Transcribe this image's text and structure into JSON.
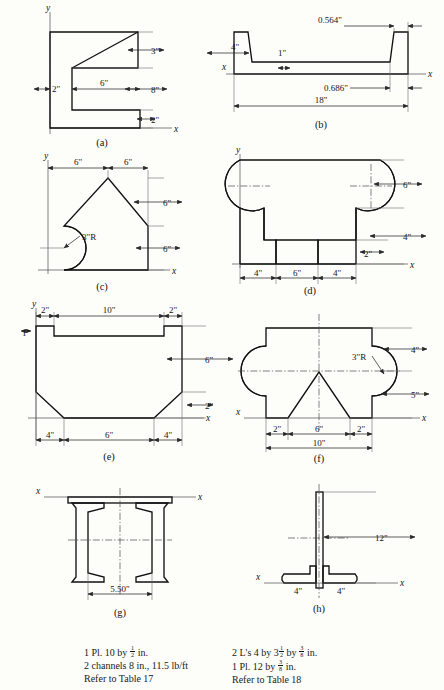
{
  "sheet": {
    "title": "Cross-section problem figures",
    "background_color": "#fdfdfa",
    "line_color": "#111111"
  },
  "panels": [
    {
      "key": "a",
      "label": "(a)",
      "shape": "channel-with-tapered-top-flange",
      "axes": {
        "x": "x",
        "y": "y"
      },
      "dimensions": [
        {
          "value": "3\"",
          "orientation": "vertical",
          "meaning": "top flange depth at right"
        },
        {
          "value": "8\"",
          "orientation": "vertical",
          "meaning": "web clear height"
        },
        {
          "value": "2\"",
          "orientation": "vertical",
          "meaning": "bottom flange thickness"
        },
        {
          "value": "2\"",
          "orientation": "horizontal",
          "meaning": "web thickness"
        },
        {
          "value": "6\"",
          "orientation": "horizontal",
          "meaning": "flange clear projection"
        }
      ]
    },
    {
      "key": "b",
      "label": "(b)",
      "shape": "rolled-channel-section",
      "axes": {
        "x": "x",
        "y": ""
      },
      "dimensions": [
        {
          "value": "4\"",
          "orientation": "vertical",
          "meaning": "overall depth of channel legs"
        },
        {
          "value": "1\"",
          "orientation": "vertical",
          "meaning": "web plate thickness"
        },
        {
          "value": "0.564\"",
          "orientation": "horizontal",
          "meaning": "flange thickness at top"
        },
        {
          "value": "0.686\"",
          "orientation": "horizontal",
          "meaning": "flange thickness at base"
        },
        {
          "value": "18\"",
          "orientation": "horizontal",
          "meaning": "overall width"
        }
      ]
    },
    {
      "key": "c",
      "label": "(c)",
      "shape": "pentagon-with-semicircular-notch",
      "axes": {
        "x": "x",
        "y": "y"
      },
      "dimensions": [
        {
          "value": "6\"",
          "orientation": "horizontal",
          "meaning": "left half width"
        },
        {
          "value": "6\"",
          "orientation": "horizontal",
          "meaning": "right half width"
        },
        {
          "value": "6\"",
          "orientation": "vertical",
          "meaning": "upper sloped height"
        },
        {
          "value": "6\"",
          "orientation": "vertical",
          "meaning": "lower vertical height"
        },
        {
          "value": "3\"R",
          "orientation": "radius",
          "meaning": "semicircular notch radius on left edge"
        }
      ]
    },
    {
      "key": "d",
      "label": "(d)",
      "shape": "rectangle-with-two-circular-notches-and-bottom-slot",
      "axes": {
        "x": "x",
        "y": "y"
      },
      "dimensions": [
        {
          "value": "6\"",
          "orientation": "vertical",
          "meaning": "upper block height"
        },
        {
          "value": "4\"",
          "orientation": "vertical",
          "meaning": "lower block height"
        },
        {
          "value": "2\"",
          "orientation": "vertical",
          "meaning": "bottom slot depth"
        },
        {
          "value": "4\"",
          "orientation": "horizontal",
          "meaning": "left leg width"
        },
        {
          "value": "6\"",
          "orientation": "horizontal",
          "meaning": "slot width"
        },
        {
          "value": "4\"",
          "orientation": "horizontal",
          "meaning": "right leg width"
        }
      ]
    },
    {
      "key": "e",
      "label": "(e)",
      "shape": "trapezoidal-trough-section",
      "axes": {
        "x": "x",
        "y": "y"
      },
      "dimensions": [
        {
          "value": "2\"",
          "orientation": "horizontal",
          "meaning": "left lip width"
        },
        {
          "value": "10\"",
          "orientation": "horizontal",
          "meaning": "central recess width"
        },
        {
          "value": "2\"",
          "orientation": "horizontal",
          "meaning": "right lip width"
        },
        {
          "value": "1\"",
          "orientation": "vertical",
          "meaning": "lip thickness"
        },
        {
          "value": "6\"",
          "orientation": "vertical",
          "meaning": "vertical side height"
        },
        {
          "value": "2\"",
          "orientation": "vertical",
          "meaning": "sloped bottom height"
        },
        {
          "value": "4\"",
          "orientation": "horizontal",
          "meaning": "left chamfer run"
        },
        {
          "value": "6\"",
          "orientation": "horizontal",
          "meaning": "flat bottom width"
        },
        {
          "value": "4\"",
          "orientation": "horizontal",
          "meaning": "right chamfer run"
        }
      ]
    },
    {
      "key": "f",
      "label": "(f)",
      "shape": "rectangle-with-side-semicircles-and-triangular-notch",
      "axes": {
        "x": "x",
        "y": "x"
      },
      "dimensions": [
        {
          "value": "4\"",
          "orientation": "vertical",
          "meaning": "height above circle centerline"
        },
        {
          "value": "5\"",
          "orientation": "vertical",
          "meaning": "height below circle centerline"
        },
        {
          "value": "3\"R",
          "orientation": "radius",
          "meaning": "side semicircle radius"
        },
        {
          "value": "2\"",
          "orientation": "horizontal",
          "meaning": "left foot width"
        },
        {
          "value": "6\"",
          "orientation": "horizontal",
          "meaning": "triangular notch base"
        },
        {
          "value": "2\"",
          "orientation": "horizontal",
          "meaning": "right foot width"
        },
        {
          "value": "10\"",
          "orientation": "horizontal",
          "meaning": "overall base width"
        }
      ]
    },
    {
      "key": "g",
      "label": "(g)",
      "shape": "two-channels-with-cover-plate",
      "axes": {
        "x": "x",
        "y": ""
      },
      "dimensions": [
        {
          "value": "5.50\"",
          "orientation": "horizontal",
          "meaning": "clear spacing between channel webs"
        }
      ]
    },
    {
      "key": "h",
      "label": "(h)",
      "shape": "tee-built-up-of-two-angles-and-plate",
      "axes": {
        "x": "x",
        "y": ""
      },
      "dimensions": [
        {
          "value": "12\"",
          "orientation": "vertical",
          "meaning": "overall plate depth"
        },
        {
          "value": "4\"",
          "orientation": "horizontal",
          "meaning": "left angle leg"
        },
        {
          "value": "4\"",
          "orientation": "horizontal",
          "meaning": "right angle leg"
        }
      ]
    }
  ],
  "captions": {
    "left": {
      "lines": [
        {
          "parts": [
            {
              "t": "1 Pl. 10 by "
            },
            {
              "frac": [
                "1",
                "2"
              ]
            },
            {
              "t": " in."
            }
          ]
        },
        {
          "parts": [
            {
              "t": "2 channels 8 in., 11.5 lb/ft"
            }
          ]
        },
        {
          "parts": [
            {
              "t": "Refer to Table 17"
            }
          ]
        }
      ],
      "plain": [
        "1 Pl. 10 by 1/2 in.",
        "2 channels 8 in., 11.5 lb/ft",
        "Refer to Table 17"
      ]
    },
    "right": {
      "lines": [
        {
          "parts": [
            {
              "t": "2 L's 4 by 3"
            },
            {
              "frac": [
                "1",
                "2"
              ]
            },
            {
              "t": " by "
            },
            {
              "frac": [
                "3",
                "8"
              ]
            },
            {
              "t": " in."
            }
          ]
        },
        {
          "parts": [
            {
              "t": "1 Pl. 12 by "
            },
            {
              "frac": [
                "3",
                "8"
              ]
            },
            {
              "t": " in."
            }
          ]
        },
        {
          "parts": [
            {
              "t": "Refer to Table 18"
            }
          ]
        }
      ],
      "plain": [
        "2 L's 4 by 3 1/2 by 3/8 in.",
        "1 Pl. 12 by 3/8 in.",
        "Refer to Table 18"
      ]
    }
  }
}
